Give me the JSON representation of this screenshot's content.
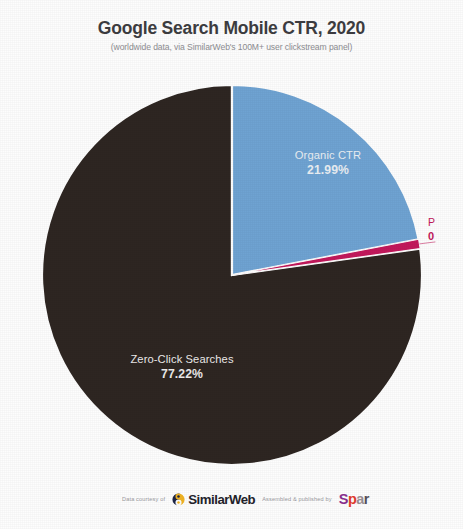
{
  "header": {
    "title": "Google Search Mobile CTR, 2020",
    "subtitle": "(worldwide data, via SimilarWeb's 100M+ user clickstream panel)"
  },
  "chart_data": {
    "type": "pie",
    "title": "Google Search Mobile CTR, 2020",
    "subtitle": "(worldwide data, via SimilarWeb's 100M+ user clickstream panel)",
    "xlabel": "",
    "ylabel": "",
    "legend_position": "none",
    "grid": false,
    "labels_inside_slices": true,
    "start_angle_deg": 0,
    "direction": "clockwise",
    "categories": [
      "Organic CTR",
      "Paid CTR",
      "Zero-Click Searches"
    ],
    "values": [
      21.99,
      0.79,
      77.22
    ],
    "value_labels": [
      "21.99%",
      "0.79%",
      "77.22%"
    ],
    "colors": [
      "#6fa3d2",
      "#c2185b",
      "#2e2622"
    ],
    "slices": [
      {
        "name": "Organic CTR",
        "value": 21.99,
        "value_label": "21.99%",
        "color": "#6fa3d2",
        "label_color": "#e9eef3",
        "label_truncated": false
      },
      {
        "name": "Paid CTR",
        "value": 0.79,
        "value_label": "0.79%",
        "color": "#c2185b",
        "label_color": "#c2185b",
        "label_truncated": true,
        "visible_name_fragment": "P",
        "visible_value_fragment": "0"
      },
      {
        "name": "Zero-Click Searches",
        "value": 77.22,
        "value_label": "77.22%",
        "color": "#2e2622",
        "label_color": "#eceaea",
        "label_truncated": false
      }
    ]
  },
  "labels": {
    "organic": {
      "name": "Organic CTR",
      "value": "21.99%"
    },
    "zeroclick": {
      "name": "Zero-Click Searches",
      "value": "77.22%"
    },
    "paid": {
      "name": "P",
      "value": "0"
    }
  },
  "footer": {
    "data_courtesy": "Data courtesy of",
    "similarweb_name": "SimilarWeb",
    "published_by": "Assembled & published by",
    "publisher_1": "S",
    "publisher_2": "p",
    "publisher_3": "a",
    "publisher_4": "r"
  },
  "colors": {
    "background": "#fdfdfd",
    "title": "#3d3d41",
    "subtitle": "#8d8d92",
    "organic": "#6fa3d2",
    "paid": "#c2185b",
    "zeroclick": "#2e2622",
    "similarweb_mark_dark": "#1d2545",
    "similarweb_mark_gold": "#f0b323"
  }
}
